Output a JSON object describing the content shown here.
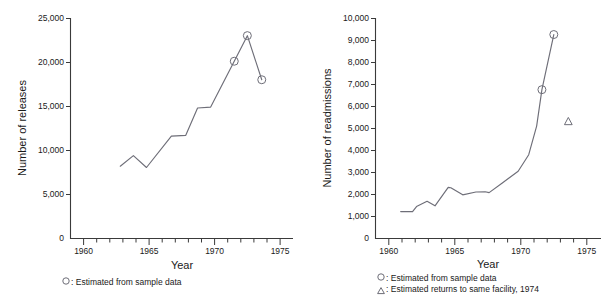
{
  "figure": {
    "background_color": "#ffffff",
    "line_color": "#6e6e78",
    "axis_color": "#3a3a3a"
  },
  "chart_data": [
    {
      "id": "releases",
      "type": "line",
      "title": "",
      "xlabel": "Year",
      "ylabel": "Number of releases",
      "xlim": [
        1959,
        1976
      ],
      "ylim": [
        0,
        25000
      ],
      "grid": false,
      "legend_position": "below-left",
      "x_ticks_major": [
        1960,
        1965,
        1970,
        1975
      ],
      "x_tick_labels": [
        "1960",
        "1965",
        "1970",
        "1975"
      ],
      "x_ticks_minor": [
        1961,
        1962,
        1963,
        1964,
        1966,
        1967,
        1968,
        1969,
        1971,
        1972,
        1973,
        1974
      ],
      "y_ticks": [
        0,
        5000,
        10000,
        15000,
        20000,
        25000
      ],
      "y_tick_labels": [
        "0",
        "5,000",
        "10,000",
        "15,000",
        "20,000",
        "25,000"
      ],
      "x": [
        1962.8,
        1963.8,
        1964.8,
        1966.7,
        1967.8,
        1968.7,
        1969.7,
        1971.5,
        1972.5,
        1973.6
      ],
      "values": [
        8200,
        9400,
        8050,
        11600,
        11700,
        14800,
        14900,
        20100,
        23000,
        18000
      ],
      "markers": [
        {
          "x": 1971.5,
          "y": 20100,
          "shape": "circle",
          "label": "Estimated from sample data"
        },
        {
          "x": 1972.5,
          "y": 23000,
          "shape": "circle",
          "label": "Estimated from sample data"
        },
        {
          "x": 1973.6,
          "y": 18000,
          "shape": "circle",
          "label": "Estimated from sample data"
        }
      ],
      "legend": [
        {
          "symbol": "circle",
          "text": "Estimated from sample data"
        }
      ]
    },
    {
      "id": "readmissions",
      "type": "line",
      "title": "",
      "xlabel": "Year",
      "ylabel": "Number of readmissions",
      "xlim": [
        1959,
        1976
      ],
      "ylim": [
        0,
        10000
      ],
      "grid": false,
      "legend_position": "below-left",
      "x_ticks_major": [
        1960,
        1965,
        1970,
        1975
      ],
      "x_tick_labels": [
        "1960",
        "1965",
        "1970",
        "1975"
      ],
      "x_ticks_minor": [
        1961,
        1962,
        1963,
        1964,
        1966,
        1967,
        1968,
        1969,
        1971,
        1972,
        1973,
        1974
      ],
      "y_ticks": [
        0,
        1000,
        2000,
        3000,
        4000,
        5000,
        6000,
        7000,
        8000,
        9000,
        10000
      ],
      "y_tick_labels": [
        "0",
        "1,000",
        "2,000",
        "3,000",
        "4,000",
        "5,000",
        "6,000",
        "7,000",
        "8,000",
        "9,000",
        "10,000"
      ],
      "x": [
        1960.9,
        1961.8,
        1962.1,
        1962.9,
        1963.5,
        1964.5,
        1964.7,
        1965.6,
        1966.6,
        1967.3,
        1967.6,
        1968.6,
        1969.8,
        1970.6,
        1971.2,
        1971.6,
        1972.5
      ],
      "values": [
        1220,
        1220,
        1450,
        1690,
        1480,
        2320,
        2300,
        1980,
        2110,
        2120,
        2080,
        2520,
        3050,
        3800,
        5100,
        6750,
        9250
      ],
      "markers": [
        {
          "x": 1971.6,
          "y": 6750,
          "shape": "circle",
          "label": "Estimated from sample data"
        },
        {
          "x": 1972.5,
          "y": 9250,
          "shape": "circle",
          "label": "Estimated from sample data"
        },
        {
          "x": 1973.6,
          "y": 5300,
          "shape": "triangle",
          "label": "Estimated returns to same facility, 1974"
        }
      ],
      "legend": [
        {
          "symbol": "circle",
          "text": "Estimated from sample data"
        },
        {
          "symbol": "triangle",
          "text": "Estimated returns to same facility, 1974"
        }
      ]
    }
  ],
  "left": {
    "ylabel": "Number of releases",
    "xlabel": "Year",
    "y_tick_labels": [
      "25,000",
      "20,000",
      "15,000",
      "10,000",
      "5,000",
      "0"
    ],
    "x_tick_labels": [
      "1960",
      "1965",
      "1970",
      "1975"
    ],
    "legend": {
      "symbol_circle": "○",
      "entry_1": ": Estimated from sample data"
    }
  },
  "right": {
    "ylabel": "Number of readmissions",
    "xlabel": "Year",
    "y_tick_labels": [
      "10,000",
      "9,000",
      "8,000",
      "7,000",
      "6,000",
      "5,000",
      "4,000",
      "3,000",
      "2,000",
      "1,000",
      "0"
    ],
    "x_tick_labels": [
      "1960",
      "1965",
      "1970",
      "1975"
    ],
    "legend": {
      "symbol_circle": "○",
      "symbol_triangle": "△",
      "entry_1": ": Estimated from sample data",
      "entry_2": ": Estimated returns to same facility, 1974"
    }
  }
}
